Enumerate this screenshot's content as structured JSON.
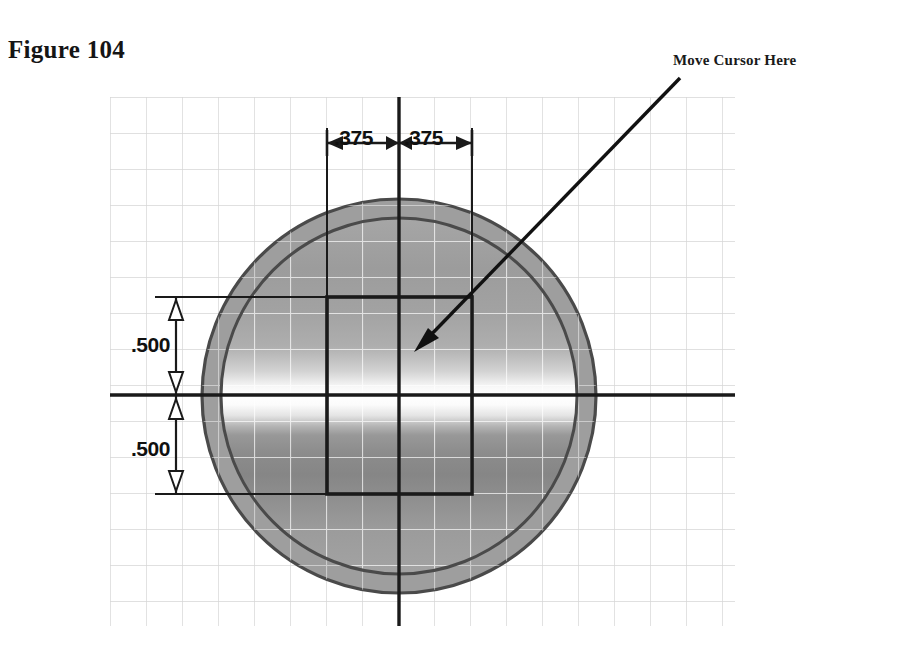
{
  "figure": {
    "caption": "Figure 104"
  },
  "annotation": {
    "callout_label": "Move Cursor Here",
    "arrow": {
      "name": "callout-arrow",
      "from_x": 680,
      "from_y": 78,
      "to_x": 417,
      "to_y": 349
    }
  },
  "dimensions": {
    "horizontal": [
      {
        "name": "dim-375-left",
        "value": ".375"
      },
      {
        "name": "dim-375-right",
        "value": ".375"
      }
    ],
    "vertical": [
      {
        "name": "dim-500-top",
        "value": ".500"
      },
      {
        "name": "dim-500-bottom",
        "value": ".500"
      }
    ]
  },
  "geometry": {
    "circle": {
      "center_x": 399,
      "center_y": 396,
      "outer_radius": 197,
      "inner_radius": 178
    },
    "rectangle": {
      "left": 327,
      "top": 297,
      "right": 472,
      "bottom": 494
    },
    "grid": {
      "left": 110,
      "top": 97,
      "right": 735,
      "bottom": 626,
      "spacing": 36
    },
    "axes": {
      "horizontal_y": 395,
      "vertical_x": 399
    }
  },
  "colors": {
    "grid_line": "#d5d5d5",
    "ring_fill": "#9e9e9e",
    "ring_stroke": "#4a4a4a",
    "body_dark": "#8f8f8f",
    "body_mid": "#a8a8a8",
    "highlight": "#ffffff",
    "outline": "#1a1a1a",
    "text": "#151515",
    "page_background": "#ffffff"
  }
}
